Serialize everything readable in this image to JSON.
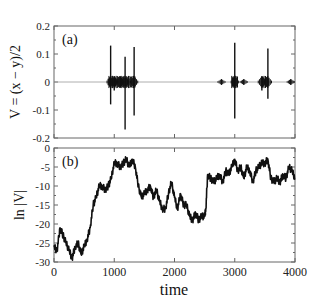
{
  "chart_data": [
    {
      "panel": "(a)",
      "type": "line",
      "title": "",
      "xlabel": "",
      "ylabel": "V = (x − y)/2",
      "xlim": [
        0,
        4000
      ],
      "ylim": [
        -0.2,
        0.2
      ],
      "xticks": [
        0,
        1000,
        2000,
        3000,
        4000
      ],
      "yticks": [
        -0.2,
        -0.1,
        0,
        0.1,
        0.2
      ],
      "ytick_labels": [
        "-0.2",
        "-0.1",
        "0",
        "0.1",
        "0.2"
      ],
      "grid": false,
      "bursts": [
        {
          "t": 940,
          "max": 0.13,
          "min": -0.08
        },
        {
          "t": 1000,
          "max": 0.02,
          "min": -0.03
        },
        {
          "t": 1100,
          "max": 0.02,
          "min": -0.02
        },
        {
          "t": 1180,
          "max": 0.09,
          "min": -0.17
        },
        {
          "t": 1330,
          "max": 0.125,
          "min": -0.12
        },
        {
          "t": 2780,
          "max": 0.01,
          "min": -0.01
        },
        {
          "t": 3000,
          "max": 0.14,
          "min": -0.13
        },
        {
          "t": 3150,
          "max": 0.01,
          "min": -0.01
        },
        {
          "t": 3450,
          "max": 0.02,
          "min": -0.03
        },
        {
          "t": 3550,
          "max": 0.12,
          "min": -0.06
        },
        {
          "t": 3930,
          "max": 0.01,
          "min": -0.01
        }
      ],
      "baseline": 0
    },
    {
      "panel": "(b)",
      "type": "line",
      "title": "",
      "xlabel": "time",
      "ylabel": "ln |V|",
      "xlim": [
        0,
        4000
      ],
      "ylim": [
        -30,
        0
      ],
      "xticks": [
        0,
        1000,
        2000,
        3000,
        4000
      ],
      "yticks": [
        -30,
        -25,
        -20,
        -15,
        -10,
        -5,
        0
      ],
      "ytick_labels": [
        "-30",
        "-25",
        "-20",
        "-15",
        "-10",
        "-5",
        "0"
      ],
      "grid": false,
      "x": [
        0,
        50,
        100,
        150,
        200,
        250,
        300,
        350,
        400,
        450,
        500,
        550,
        600,
        650,
        700,
        750,
        800,
        850,
        900,
        950,
        1000,
        1050,
        1100,
        1150,
        1200,
        1250,
        1300,
        1350,
        1400,
        1450,
        1500,
        1550,
        1600,
        1650,
        1700,
        1750,
        1800,
        1850,
        1900,
        1950,
        2000,
        2050,
        2100,
        2150,
        2200,
        2250,
        2300,
        2350,
        2400,
        2450,
        2500,
        2520,
        2550,
        2600,
        2650,
        2700,
        2750,
        2800,
        2850,
        2900,
        2950,
        3000,
        3050,
        3100,
        3150,
        3200,
        3250,
        3300,
        3350,
        3400,
        3450,
        3500,
        3550,
        3600,
        3650,
        3700,
        3750,
        3800,
        3850,
        3900,
        3950,
        4000
      ],
      "values": [
        -26,
        -27,
        -21,
        -23,
        -25,
        -27,
        -29,
        -26,
        -25,
        -28,
        -26,
        -24,
        -21,
        -15,
        -13,
        -10,
        -10,
        -11,
        -10,
        -8,
        -4,
        -4,
        -5,
        -4,
        -3,
        -5,
        -3,
        -5,
        -10,
        -13,
        -12,
        -11,
        -10,
        -13,
        -11,
        -14,
        -16,
        -16,
        -12,
        -9,
        -13,
        -16,
        -12,
        -15,
        -15,
        -18,
        -19,
        -17,
        -19,
        -18,
        -18,
        -16,
        -7,
        -8,
        -9,
        -8,
        -7,
        -9,
        -6,
        -7,
        -5,
        -3,
        -6,
        -5,
        -8,
        -5,
        -6,
        -9,
        -6,
        -5,
        -4,
        -4,
        -3,
        -8,
        -9,
        -8,
        -9,
        -7,
        -8,
        -5,
        -6,
        -8
      ]
    }
  ],
  "figure": {
    "panel_a_label": "(a)",
    "panel_b_label": "(b)",
    "panel_a_ylabel": "V = (x − y)/2",
    "panel_b_ylabel": "ln |V|",
    "xlabel": "time",
    "x_tick_labels": [
      "0",
      "1000",
      "2000",
      "3000",
      "4000"
    ],
    "a_tick_labels": [
      "0.2",
      "0.1",
      "0",
      "-0.1",
      "-0.2"
    ],
    "b_tick_labels": [
      "0",
      "-5",
      "-10",
      "-15",
      "-20",
      "-25",
      "-30"
    ],
    "line_color": "#111111",
    "frame_color": "#666666"
  }
}
